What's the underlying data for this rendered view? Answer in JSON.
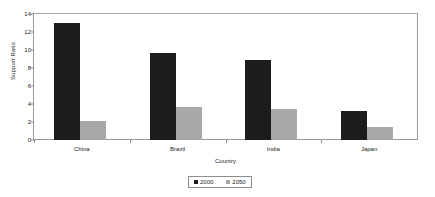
{
  "chart_data": {
    "type": "bar",
    "title": "",
    "xlabel": "Country",
    "ylabel": "Support Ratio",
    "categories": [
      "China",
      "Brazil",
      "India",
      "Japan"
    ],
    "series": [
      {
        "name": "2000",
        "color": "#1c1c1c",
        "values": [
          13.0,
          9.7,
          8.9,
          3.2
        ]
      },
      {
        "name": "2050",
        "color": "#a8a8a8",
        "values": [
          2.1,
          3.7,
          3.4,
          1.4
        ]
      }
    ],
    "ylim": [
      0,
      14
    ],
    "yticks": [
      0,
      2,
      4,
      6,
      8,
      10,
      12,
      14
    ],
    "ytick_labels": [
      "0",
      "2",
      "4",
      "6",
      "8",
      "10",
      "12",
      "14"
    ],
    "grid": false,
    "legend_position": "bottom"
  }
}
